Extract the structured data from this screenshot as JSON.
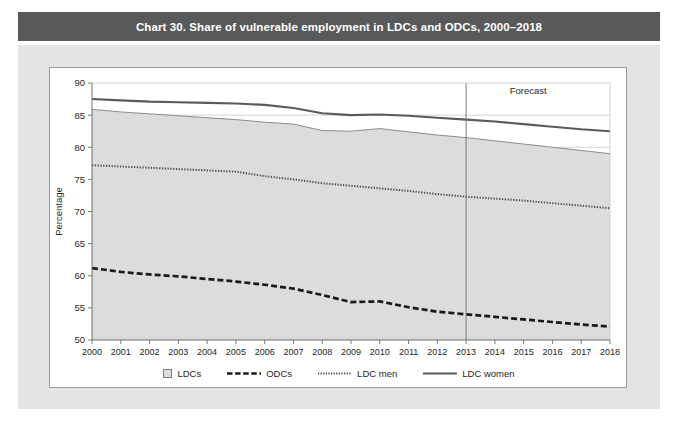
{
  "header": {
    "title": "Chart 30. Share of vulnerable employment in LDCs and ODCs, 2000–2018"
  },
  "annotations": {
    "forecast_label": "Forecast",
    "forecast_start_year": 2013
  },
  "colors": {
    "title_bar": "#58595b",
    "title_text": "#ffffff",
    "outer_panel": "#e3e4e6",
    "plot_card": "#ffffff",
    "area_fill": "#dcdcdc",
    "area_edge": "#8c8c8c",
    "odcs_line": "#1a1a1a",
    "ldc_men_line": "#4d4d4d",
    "ldc_women_line": "#5a5a5a",
    "axis": "#6e6e6e",
    "grid": "#c9c9c9"
  },
  "legend": {
    "position": "bottom",
    "items": [
      {
        "label": "LDCs",
        "style": "area"
      },
      {
        "label": "ODCs",
        "style": "dashed"
      },
      {
        "label": "LDC men",
        "style": "dotted"
      },
      {
        "label": "LDC women",
        "style": "solid"
      }
    ]
  },
  "chart_data": {
    "type": "line",
    "title": "Chart 30. Share of vulnerable employment in LDCs and ODCs, 2000–2018",
    "xlabel": "",
    "ylabel": "Percentage",
    "ylim": [
      50,
      90
    ],
    "yticks": [
      50,
      55,
      60,
      65,
      70,
      75,
      80,
      85,
      90
    ],
    "grid": true,
    "x": [
      2000,
      2001,
      2002,
      2003,
      2004,
      2005,
      2006,
      2007,
      2008,
      2009,
      2010,
      2011,
      2012,
      2013,
      2014,
      2015,
      2016,
      2017,
      2018
    ],
    "categories": [
      "2000",
      "2001",
      "2002",
      "2003",
      "2004",
      "2005",
      "2006",
      "2007",
      "2008",
      "2009",
      "2010",
      "2011",
      "2012",
      "2013",
      "2014",
      "2015",
      "2016",
      "2017",
      "2018"
    ],
    "series": [
      {
        "name": "LDCs",
        "style": "area",
        "values": [
          85.9,
          85.5,
          85.2,
          84.9,
          84.6,
          84.3,
          83.9,
          83.6,
          82.6,
          82.5,
          82.9,
          82.4,
          81.9,
          81.5,
          81.0,
          80.5,
          80.0,
          79.5,
          79.0
        ]
      },
      {
        "name": "ODCs",
        "style": "dashed",
        "values": [
          61.2,
          60.6,
          60.2,
          59.9,
          59.5,
          59.1,
          58.6,
          58.0,
          57.0,
          55.9,
          56.0,
          55.1,
          54.4,
          54.0,
          53.6,
          53.2,
          52.8,
          52.4,
          52.1
        ]
      },
      {
        "name": "LDC men",
        "style": "dotted",
        "values": [
          77.2,
          77.0,
          76.8,
          76.6,
          76.4,
          76.2,
          75.5,
          75.0,
          74.4,
          74.0,
          73.6,
          73.2,
          72.7,
          72.3,
          72.0,
          71.7,
          71.3,
          70.9,
          70.5
        ]
      },
      {
        "name": "LDC women",
        "style": "solid",
        "values": [
          87.5,
          87.3,
          87.1,
          87.0,
          86.9,
          86.8,
          86.6,
          86.1,
          85.3,
          85.0,
          85.1,
          84.9,
          84.6,
          84.3,
          84.0,
          83.6,
          83.2,
          82.8,
          82.5
        ]
      }
    ]
  }
}
